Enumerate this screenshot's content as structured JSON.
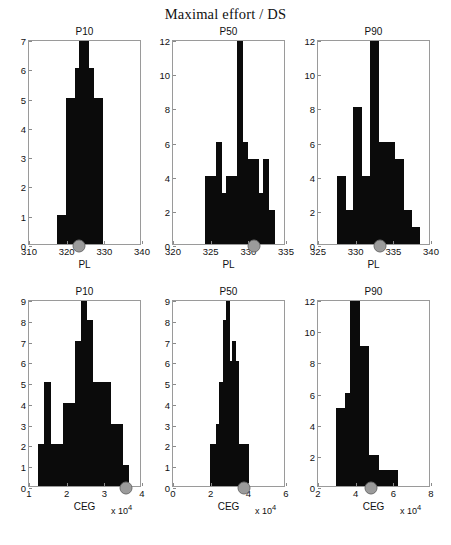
{
  "figure": {
    "title": "Maximal effort / DS",
    "exponent_label": "x 10"
  },
  "chart_data": [
    {
      "type": "bar",
      "title": "P10",
      "xlabel": "PL",
      "ylabel": "",
      "xlim": [
        310,
        340
      ],
      "ylim": [
        0,
        7
      ],
      "xticks": [
        310,
        320,
        330,
        340
      ],
      "yticks": [
        0,
        1,
        2,
        3,
        4,
        5,
        6,
        7
      ],
      "bin_edges": [
        317.4,
        318.6,
        319.8,
        321.0,
        322.2,
        323.4,
        324.6,
        325.8,
        327.0,
        328.2,
        329.4
      ],
      "values": [
        1,
        1,
        5,
        5,
        6,
        7,
        7,
        6,
        5,
        5
      ],
      "marker_x": 323.2,
      "marker_y": 0,
      "grid": false,
      "legend": false
    },
    {
      "type": "bar",
      "title": "P50",
      "xlabel": "PL",
      "ylabel": "",
      "xlim": [
        320,
        335
      ],
      "ylim": [
        0,
        12
      ],
      "xticks": [
        320,
        325,
        330,
        335
      ],
      "yticks": [
        0,
        2,
        4,
        6,
        8,
        10,
        12
      ],
      "bin_edges": [
        324.3,
        325.0,
        325.7,
        326.4,
        327.1,
        327.8,
        328.5,
        329.2,
        329.9,
        330.6,
        331.3,
        332.0,
        332.7,
        333.4
      ],
      "values": [
        4,
        4,
        6,
        3,
        4,
        4,
        12,
        6,
        5,
        5,
        3,
        5,
        2
      ],
      "marker_x": 330.8,
      "marker_y": 0,
      "grid": false,
      "legend": false
    },
    {
      "type": "bar",
      "title": "P90",
      "xlabel": "PL",
      "ylabel": "",
      "xlim": [
        325,
        340
      ],
      "ylim": [
        0,
        12
      ],
      "xticks": [
        325,
        330,
        335,
        340
      ],
      "yticks": [
        0,
        2,
        4,
        6,
        8,
        10,
        12
      ],
      "bin_edges": [
        327.5,
        328.6,
        329.7,
        330.8,
        331.9,
        333.0,
        334.1,
        335.2,
        336.3,
        337.4,
        338.5
      ],
      "values": [
        4,
        2,
        8,
        4,
        12,
        6,
        6,
        5,
        2,
        1
      ],
      "marker_x": 333.2,
      "marker_y": 0,
      "grid": false,
      "legend": false
    },
    {
      "type": "bar",
      "title": "P10",
      "xlabel": "CEG",
      "ylabel": "",
      "xlim": [
        10000,
        40000
      ],
      "ylim": [
        0,
        9
      ],
      "xticks": [
        10000,
        20000,
        30000,
        40000
      ],
      "xticklabels": [
        "1",
        "2",
        "3",
        "4"
      ],
      "yticks": [
        0,
        1,
        2,
        3,
        4,
        5,
        6,
        7,
        8,
        9
      ],
      "bin_edges": [
        12500,
        14100,
        15700,
        17300,
        18900,
        20500,
        22100,
        23700,
        25300,
        26900,
        28500,
        30100,
        31700,
        33300,
        34900,
        36500
      ],
      "values": [
        2,
        5,
        2,
        2,
        4,
        4,
        7,
        9,
        8,
        5,
        5,
        5,
        3,
        3,
        1
      ],
      "marker_x": 35800,
      "marker_y": 0,
      "grid": false,
      "legend": false
    },
    {
      "type": "bar",
      "title": "P50",
      "xlabel": "CEG",
      "ylabel": "",
      "xlim": [
        0,
        60000
      ],
      "ylim": [
        0,
        9
      ],
      "xticks": [
        0,
        20000,
        40000,
        60000
      ],
      "xticklabels": [
        "0",
        "2",
        "4",
        "6"
      ],
      "yticks": [
        0,
        1,
        2,
        3,
        4,
        5,
        6,
        7,
        8,
        9
      ],
      "bin_edges": [
        19500,
        21200,
        22900,
        24600,
        26300,
        28000,
        29700,
        31400,
        33100,
        34800,
        36500,
        38200,
        39900
      ],
      "values": [
        2,
        2,
        3,
        5,
        8,
        9,
        6,
        7,
        6,
        2,
        2,
        2
      ],
      "marker_x": 37800,
      "marker_y": 0,
      "grid": false,
      "legend": false
    },
    {
      "type": "bar",
      "title": "P90",
      "xlabel": "CEG",
      "ylabel": "",
      "xlim": [
        20000,
        80000
      ],
      "ylim": [
        0,
        12
      ],
      "xticks": [
        20000,
        40000,
        60000,
        80000
      ],
      "xticklabels": [
        "2",
        "4",
        "6",
        "8"
      ],
      "yticks": [
        0,
        2,
        4,
        6,
        8,
        10,
        12
      ],
      "bin_edges": [
        29500,
        32000,
        34500,
        37000,
        39500,
        42000,
        44500,
        47000,
        49500,
        52000,
        54500,
        57000,
        59500,
        62000
      ],
      "values": [
        5,
        5,
        6,
        12,
        12,
        9,
        9,
        2,
        2,
        1,
        1,
        1,
        1
      ],
      "marker_x": 48000,
      "marker_y": 0,
      "grid": false,
      "legend": false
    }
  ]
}
